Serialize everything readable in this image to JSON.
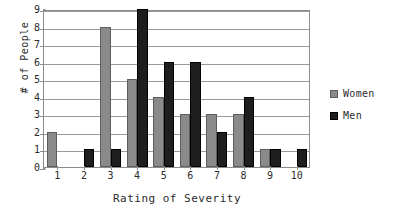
{
  "chart_data": {
    "type": "bar",
    "title": "",
    "xlabel": "Rating of Severity",
    "ylabel": "# of People",
    "categories": [
      "1",
      "2",
      "3",
      "4",
      "5",
      "6",
      "7",
      "8",
      "9",
      "10"
    ],
    "series": [
      {
        "name": "Women",
        "color": "#8a8a8a",
        "values": [
          2,
          0,
          8,
          5,
          4,
          3,
          3,
          3,
          1,
          0
        ]
      },
      {
        "name": "Men",
        "color": "#1e1e1e",
        "values": [
          0,
          1,
          1,
          9,
          6,
          6,
          2,
          4,
          1,
          1
        ]
      }
    ],
    "ylim": [
      0,
      9
    ],
    "yticks": [
      "0",
      "1",
      "2",
      "3",
      "4",
      "5",
      "6",
      "7",
      "8",
      "9"
    ],
    "grid": true,
    "legend_position": "right"
  },
  "legend": {
    "items": [
      {
        "label": "Women"
      },
      {
        "label": "Men"
      }
    ]
  }
}
